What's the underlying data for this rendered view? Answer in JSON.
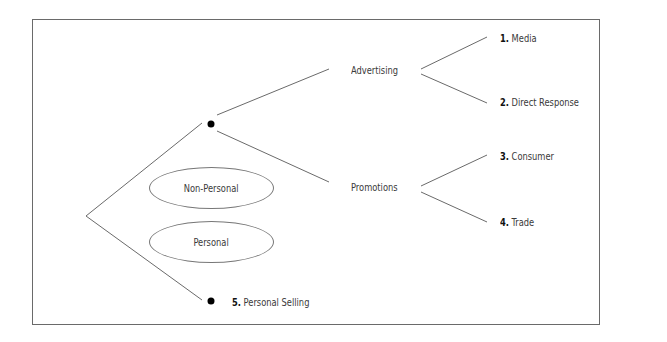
{
  "diagram": {
    "type": "tree",
    "nodes": {
      "non_personal": "Non-Personal",
      "personal": "Personal",
      "advertising": "Advertising",
      "promotions": "Promotions"
    },
    "leaves": [
      {
        "num": "1.",
        "label": "Media"
      },
      {
        "num": "2.",
        "label": "Direct Response"
      },
      {
        "num": "3.",
        "label": "Consumer"
      },
      {
        "num": "4.",
        "label": "Trade"
      },
      {
        "num": "5.",
        "label": "Personal Selling"
      }
    ],
    "colors": {
      "line": "#6a6a6a",
      "dot": "#000000",
      "text": "#3a3a3a"
    }
  }
}
